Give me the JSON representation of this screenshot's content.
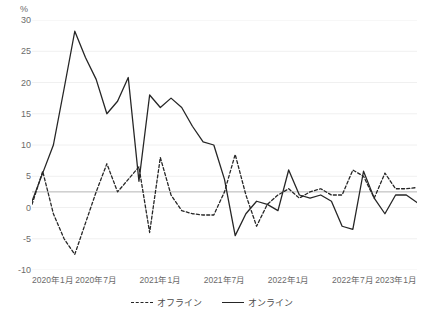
{
  "chart_data": {
    "type": "line",
    "title": "",
    "xlabel": "",
    "ylabel": "%",
    "unit_label": "%",
    "ylim": [
      -10,
      30
    ],
    "ytick_values": [
      -10,
      -5,
      0,
      5,
      10,
      15,
      20,
      25,
      30
    ],
    "ytick_labels": [
      "-10",
      "-5",
      "0",
      "5",
      "10",
      "15",
      "20",
      "25",
      "30"
    ],
    "grid": true,
    "grid_color": "#f0f0f0",
    "reference_line": {
      "value": 2.5,
      "color": "#b4b4b4"
    },
    "legend_position": "bottom",
    "x": [
      "2020年1月",
      "2020年2月",
      "2020年3月",
      "2020年4月",
      "2020年5月",
      "2020年6月",
      "2020年7月",
      "2020年8月",
      "2020年9月",
      "2020年10月",
      "2020年11月",
      "2020年12月",
      "2021年1月",
      "2021年2月",
      "2021年3月",
      "2021年4月",
      "2021年5月",
      "2021年6月",
      "2021年7月",
      "2021年8月",
      "2021年9月",
      "2021年10月",
      "2021年11月",
      "2021年12月",
      "2022年1月",
      "2022年2月",
      "2022年3月",
      "2022年4月",
      "2022年5月",
      "2022年6月",
      "2022年7月",
      "2022年8月",
      "2022年9月",
      "2022年10月",
      "2022年11月",
      "2022年12月",
      "2023年1月"
    ],
    "xtick_labels": [
      "2020年1月",
      "2020年7月",
      "2021年1月",
      "2021年7月",
      "2022年1月",
      "2022年7月",
      "2023年1月"
    ],
    "xtick_indices": [
      0,
      6,
      12,
      18,
      24,
      30,
      36
    ],
    "series": [
      {
        "name": "オフライン",
        "style": "dashed",
        "color": "#262626",
        "values": [
          0.5,
          5.8,
          -1.0,
          -5.0,
          -7.5,
          -2.5,
          2.5,
          7.0,
          2.5,
          4.5,
          6.5,
          -4.0,
          8.0,
          2.0,
          -0.5,
          -1.0,
          -1.2,
          -1.2,
          2.5,
          8.5,
          2.0,
          -3.0,
          0.5,
          2.0,
          3.0,
          1.5,
          2.5,
          3.0,
          2.0,
          2.0,
          6.0,
          5.0,
          1.5,
          5.5,
          3.0,
          3.0,
          3.2
        ]
      },
      {
        "name": "オンライン",
        "style": "solid",
        "color": "#262626",
        "values": [
          1.0,
          5.5,
          10.0,
          19.0,
          28.2,
          24.0,
          20.5,
          15.0,
          17.0,
          20.8,
          4.2,
          18.0,
          16.0,
          17.5,
          16.0,
          13.0,
          10.5,
          10.0,
          4.5,
          -4.5,
          -1.0,
          1.0,
          0.5,
          -0.5,
          6.0,
          2.0,
          1.5,
          2.0,
          1.0,
          -3.0,
          -3.5,
          5.8,
          1.5,
          -1.0,
          2.0,
          2.0,
          0.8
        ]
      }
    ]
  }
}
